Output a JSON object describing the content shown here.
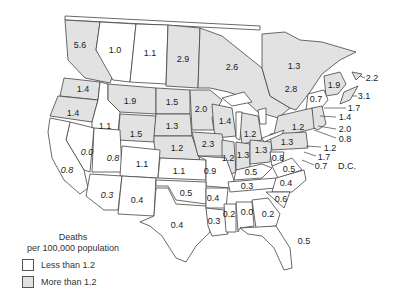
{
  "colors": {
    "shaded": "#e2e2e2",
    "unshaded": "#ffffff",
    "border": "#444444"
  },
  "legend": {
    "title_line1": "Deaths",
    "title_line2": "per 100,000 population",
    "items": [
      {
        "label": "Less than 1.2",
        "color": "#ffffff"
      },
      {
        "label": "More than 1.2",
        "color": "#e2e2e2"
      }
    ]
  },
  "annotations": {
    "dc": "D.C."
  },
  "regions": [
    {
      "name": "British Columbia",
      "value": "5.6",
      "x": 80,
      "y": 45,
      "shaded": true
    },
    {
      "name": "Alberta",
      "value": "1.0",
      "x": 115,
      "y": 50,
      "shaded": false
    },
    {
      "name": "Saskatchewan",
      "value": "1.1",
      "x": 150,
      "y": 53,
      "shaded": false
    },
    {
      "name": "Manitoba",
      "value": "2.9",
      "x": 183,
      "y": 59,
      "shaded": true
    },
    {
      "name": "Ontario",
      "value": "2.6",
      "x": 232,
      "y": 67,
      "shaded": true
    },
    {
      "name": "Quebec",
      "value": "1.3",
      "x": 294,
      "y": 66,
      "shaded": true
    },
    {
      "name": "Quebec south",
      "value": "2.8",
      "x": 291,
      "y": 89,
      "shaded": true
    },
    {
      "name": "Newfoundland",
      "value": "2.2",
      "x": 372,
      "y": 78,
      "shaded": true
    },
    {
      "name": "New Brunswick",
      "value": "1.9",
      "x": 334,
      "y": 85,
      "shaded": true
    },
    {
      "name": "Nova Scotia",
      "value": "3.1",
      "x": 364,
      "y": 96,
      "shaded": true
    },
    {
      "name": "Maine",
      "value": "0.7",
      "x": 316,
      "y": 99,
      "shaded": false
    },
    {
      "name": "New Hampshire",
      "value": "1.7",
      "x": 354,
      "y": 108,
      "shaded": true
    },
    {
      "name": "Vermont/MA",
      "value": "1.4",
      "x": 345,
      "y": 117,
      "shaded": true
    },
    {
      "name": "Rhode Island",
      "value": "2.0",
      "x": 345,
      "y": 129,
      "shaded": true
    },
    {
      "name": "Connecticut",
      "value": "0.8",
      "x": 345,
      "y": 139,
      "shaded": false
    },
    {
      "name": "New Jersey",
      "value": "1.2",
      "x": 330,
      "y": 148,
      "shaded": true
    },
    {
      "name": "Delaware",
      "value": "1.7",
      "x": 324,
      "y": 157,
      "shaded": true
    },
    {
      "name": "Maryland",
      "value": "0.7",
      "x": 321,
      "y": 166,
      "shaded": false
    },
    {
      "name": "Washington",
      "value": "1.4",
      "x": 83,
      "y": 89,
      "shaded": true
    },
    {
      "name": "Oregon",
      "value": "1.4",
      "x": 73,
      "y": 113,
      "shaded": true
    },
    {
      "name": "Idaho",
      "value": "1.1",
      "x": 105,
      "y": 126,
      "shaded": false
    },
    {
      "name": "Montana",
      "value": "1.9",
      "x": 130,
      "y": 101,
      "shaded": true
    },
    {
      "name": "Wyoming",
      "value": "1.5",
      "x": 136,
      "y": 134,
      "shaded": true
    },
    {
      "name": "North Dakota",
      "value": "1.5",
      "x": 172,
      "y": 102,
      "shaded": true
    },
    {
      "name": "South Dakota",
      "value": "1.3",
      "x": 172,
      "y": 126,
      "shaded": true
    },
    {
      "name": "Nebraska",
      "value": "1.2",
      "x": 177,
      "y": 148,
      "shaded": true
    },
    {
      "name": "Minnesota",
      "value": "2.0",
      "x": 201,
      "y": 109,
      "shaded": true
    },
    {
      "name": "Wisconsin",
      "value": "1.4",
      "x": 225,
      "y": 121,
      "shaded": true
    },
    {
      "name": "Michigan",
      "value": "1.2",
      "x": 250,
      "y": 134,
      "shaded": true
    },
    {
      "name": "Iowa",
      "value": "2.3",
      "x": 208,
      "y": 144,
      "shaded": true
    },
    {
      "name": "Illinois",
      "value": "1.2",
      "x": 228,
      "y": 158,
      "shaded": true
    },
    {
      "name": "Indiana",
      "value": "1.3",
      "x": 243,
      "y": 155,
      "shaded": true
    },
    {
      "name": "Ohio",
      "value": "1.3",
      "x": 261,
      "y": 150,
      "shaded": true
    },
    {
      "name": "New York",
      "value": "1.2",
      "x": 298,
      "y": 127,
      "shaded": true
    },
    {
      "name": "Pennsylvania",
      "value": "1.3",
      "x": 287,
      "y": 142,
      "shaded": true
    },
    {
      "name": "Nevada",
      "value": "0.0",
      "x": 87,
      "y": 152,
      "shaded": false
    },
    {
      "name": "California",
      "value": "0.8",
      "x": 67,
      "y": 170,
      "shaded": false
    },
    {
      "name": "Utah",
      "value": "0.8",
      "x": 113,
      "y": 158,
      "shaded": false
    },
    {
      "name": "Colorado",
      "value": "1.1",
      "x": 142,
      "y": 164,
      "shaded": false
    },
    {
      "name": "Kansas",
      "value": "1.1",
      "x": 179,
      "y": 171,
      "shaded": false
    },
    {
      "name": "Missouri",
      "value": "0.9",
      "x": 210,
      "y": 171,
      "shaded": false
    },
    {
      "name": "West Virginia",
      "value": "0.8",
      "x": 278,
      "y": 158,
      "shaded": false
    },
    {
      "name": "Virginia",
      "value": "0.5",
      "x": 289,
      "y": 169,
      "shaded": false
    },
    {
      "name": "Kentucky",
      "value": "0.5",
      "x": 251,
      "y": 172,
      "shaded": false
    },
    {
      "name": "Tennessee",
      "value": "0.3",
      "x": 247,
      "y": 186,
      "shaded": false
    },
    {
      "name": "North Carolina",
      "value": "0.4",
      "x": 286,
      "y": 183,
      "shaded": false
    },
    {
      "name": "Arizona",
      "value": "0.3",
      "x": 107,
      "y": 195,
      "shaded": false
    },
    {
      "name": "New Mexico",
      "value": "0.4",
      "x": 137,
      "y": 200,
      "shaded": false
    },
    {
      "name": "Oklahoma",
      "value": "0.5",
      "x": 186,
      "y": 193,
      "shaded": false
    },
    {
      "name": "Arkansas",
      "value": "0.4",
      "x": 213,
      "y": 198,
      "shaded": false
    },
    {
      "name": "South Carolina",
      "value": "0.6",
      "x": 281,
      "y": 199,
      "shaded": false
    },
    {
      "name": "Texas",
      "value": "0.4",
      "x": 177,
      "y": 225,
      "shaded": false
    },
    {
      "name": "Louisiana",
      "value": "0.3",
      "x": 214,
      "y": 221,
      "shaded": false
    },
    {
      "name": "Mississippi",
      "value": "0.2",
      "x": 229,
      "y": 214,
      "shaded": false
    },
    {
      "name": "Alabama",
      "value": "0.0",
      "x": 247,
      "y": 212,
      "shaded": false
    },
    {
      "name": "Georgia",
      "value": "0.2",
      "x": 268,
      "y": 214,
      "shaded": false
    },
    {
      "name": "Florida",
      "value": "0.5",
      "x": 304,
      "y": 241,
      "shaded": false
    }
  ]
}
